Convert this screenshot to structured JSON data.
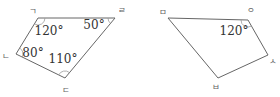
{
  "figures": [
    {
      "id": "left-quadrilateral",
      "vertices": {
        "top_left": "ㄱ",
        "top_right": "ㄹ",
        "bottom_left": "ㄴ",
        "bottom": "ㄷ"
      },
      "angles": {
        "top_left": "120°",
        "top_right": "50°",
        "bottom_left": "80°",
        "bottom": "110°"
      }
    },
    {
      "id": "right-quadrilateral",
      "vertices": {
        "top_left": "ㅁ",
        "top_right": "ㅇ",
        "right": "ㅅ",
        "bottom": "ㅂ"
      },
      "angles": {
        "top_right": "120°"
      }
    }
  ],
  "colors": {
    "line": "#666666",
    "arc": "#9a9a9a",
    "angle_text": "#333333",
    "vertex_text": "#5f5f5f",
    "background": "#ffffff"
  }
}
